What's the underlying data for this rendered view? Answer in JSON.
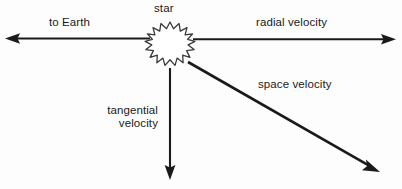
{
  "diagram": {
    "background_color": "#fdfdfd",
    "stroke_color": "#1a1a1a",
    "star": {
      "icon": "star-burst-icon",
      "label": "star",
      "center_x": 170,
      "center_y": 42,
      "outer_radius": 20,
      "inner_radius": 13,
      "points": 15,
      "fill": "#ffffff",
      "stroke": "#3a3a3a"
    },
    "vectors": [
      {
        "name": "to-earth",
        "label": "to Earth",
        "direction": "left",
        "from_x": 150,
        "from_y": 38,
        "to_x": 5,
        "to_y": 38
      },
      {
        "name": "radial-velocity",
        "label": "radial velocity",
        "direction": "right",
        "from_x": 193,
        "from_y": 39,
        "to_x": 396,
        "to_y": 39
      },
      {
        "name": "tangential-velocity",
        "label": "tangential\nvelocity",
        "label_line_1": "tangential",
        "label_line_2": "velocity",
        "direction": "down",
        "from_x": 170,
        "from_y": 68,
        "to_x": 170,
        "to_y": 180
      },
      {
        "name": "space-velocity",
        "label": "space velocity",
        "direction": "down-right",
        "from_x": 188,
        "from_y": 62,
        "to_x": 380,
        "to_y": 172
      }
    ]
  }
}
